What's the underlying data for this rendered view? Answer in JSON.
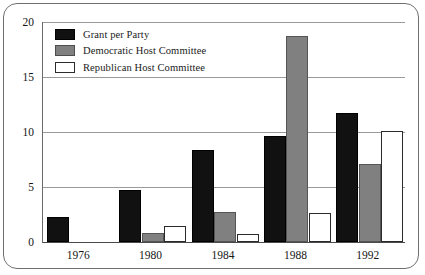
{
  "chart_data": {
    "type": "bar",
    "title": "",
    "subtitle": "",
    "xlabel": "",
    "ylabel": "",
    "categories": [
      "1976",
      "1980",
      "1984",
      "1988",
      "1992"
    ],
    "series": [
      {
        "name": "Grant per Party",
        "color": "#111111",
        "values": [
          2.3,
          4.7,
          8.4,
          9.6,
          11.7
        ]
      },
      {
        "name": "Democratic Host Committee",
        "color": "#808080",
        "values": [
          0,
          0.8,
          2.7,
          18.7,
          7.1
        ]
      },
      {
        "name": "Republican Host Committee",
        "color": "#ffffff",
        "values": [
          0,
          1.5,
          0.7,
          2.6,
          10.1
        ]
      }
    ],
    "ylim": [
      0,
      20
    ],
    "yticks": [
      0,
      5,
      10,
      15,
      20
    ],
    "ytick_labels": [
      "0",
      "5",
      "10",
      "15",
      "20"
    ],
    "grid": true,
    "grid_axis": "y",
    "legend_position": "top-left"
  },
  "legend": {
    "entries": [
      {
        "label": "Grant per Party",
        "swatch": "black-swatch-icon"
      },
      {
        "label": "Democratic Host Committee",
        "swatch": "gray-swatch-icon"
      },
      {
        "label": "Republican Host Committee",
        "swatch": "white-swatch-icon"
      }
    ]
  }
}
